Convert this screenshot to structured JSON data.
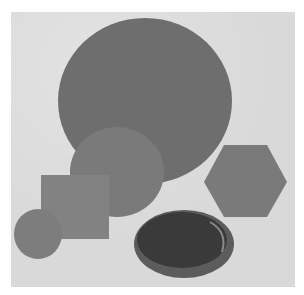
{
  "image": {
    "description": "Black and white photograph of flat geometric shapes: a large disc, a medium disc, a square plate, a small disc, a hexagonal plate and a shallow round dish, arranged on a light grey background.",
    "colors": {
      "background": "#d9d9d9",
      "large_disc": "#6e6e6e",
      "medium_disc": "#7a7a7a",
      "square": "#828282",
      "small_disc": "#7d7d7d",
      "hexagon": "#7a7a7a",
      "dish": "#3a3a3a",
      "dish_rim": "#5c5c5c"
    }
  }
}
